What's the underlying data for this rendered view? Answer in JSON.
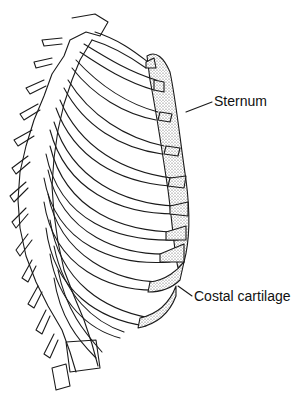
{
  "figure": {
    "labels": [
      {
        "id": "sternum",
        "text": "Sternum"
      },
      {
        "id": "costal-cartilage",
        "text": "Costal cartilage"
      }
    ],
    "colors": {
      "line": "#1a1a1a",
      "background": "#ffffff",
      "cartilage_stipple": "#9a9a9a"
    }
  }
}
